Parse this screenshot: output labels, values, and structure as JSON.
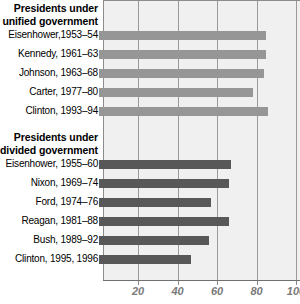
{
  "chart_data": {
    "type": "bar",
    "orientation": "horizontal",
    "title": "",
    "xlabel": "",
    "ylabel": "",
    "xlim": [
      0,
      104
    ],
    "xticks": [
      20,
      40,
      60,
      80,
      100
    ],
    "xtick_labels": [
      "20",
      "40",
      "60",
      "80",
      "100"
    ],
    "grid": true,
    "legend": "none",
    "groups": [
      {
        "name": "unified",
        "heading_line1": "Presidents under",
        "heading_line2": "unified government",
        "color": "#969696",
        "categories": [
          "Eisenhower,1953–54",
          "Kennedy, 1961–63",
          "Johnson, 1963–68",
          "Carter, 1977–80",
          "Clinton, 1993–94"
        ],
        "values": [
          85,
          85,
          84,
          78,
          86
        ]
      },
      {
        "name": "divided",
        "heading_line1": "Presidents under",
        "heading_line2": "divided government",
        "color": "#585858",
        "categories": [
          "Eisenhower, 1955–60",
          "Nixon, 1969–74",
          "Ford, 1974–76",
          "Reagan, 1981–88",
          "Bush, 1989–92",
          "Clinton, 1995, 1996"
        ],
        "values": [
          67,
          66,
          57,
          66,
          56,
          47
        ]
      }
    ]
  }
}
